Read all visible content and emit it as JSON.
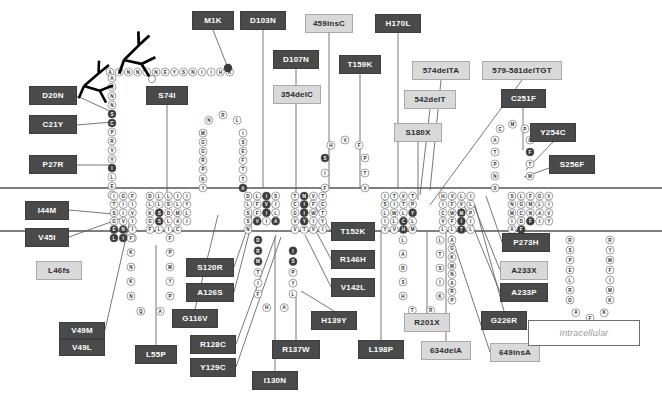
{
  "diagram": {
    "colors": {
      "mutation_dark_bg": "#4a4a4a",
      "mutation_dark_text": "#ffffff",
      "mutation_light_bg": "#d9d9d9",
      "mutation_light_text": "#2b2b2b",
      "residue_normal_fill": "#ffffff",
      "residue_mutated_fill": "#3a3a3a",
      "membrane_line": "#000000",
      "leader_line": "#555555"
    },
    "membrane": {
      "outer_line_y": 188,
      "inner_line_y": 231
    },
    "region_label": {
      "text": "Intracellular",
      "x": 578,
      "y": 333
    }
  },
  "mutations": [
    {
      "label": "M1K",
      "style": "dark",
      "x": 192,
      "y": 11,
      "w": 42,
      "h": 19
    },
    {
      "label": "D103N",
      "style": "dark",
      "x": 240,
      "y": 11,
      "w": 46,
      "h": 19
    },
    {
      "label": "459insC",
      "style": "light",
      "x": 305,
      "y": 14,
      "w": 48,
      "h": 19
    },
    {
      "label": "H170L",
      "style": "dark",
      "x": 375,
      "y": 14,
      "w": 46,
      "h": 19
    },
    {
      "label": "D107N",
      "style": "dark",
      "x": 273,
      "y": 50,
      "w": 46,
      "h": 19
    },
    {
      "label": "T159K",
      "style": "dark",
      "x": 339,
      "y": 55,
      "w": 42,
      "h": 19
    },
    {
      "label": "574delTA",
      "style": "light",
      "x": 412,
      "y": 61,
      "w": 58,
      "h": 19
    },
    {
      "label": "579-581delTGT",
      "style": "light",
      "x": 482,
      "y": 61,
      "w": 80,
      "h": 19
    },
    {
      "label": "354delC",
      "style": "light",
      "x": 273,
      "y": 85,
      "w": 48,
      "h": 19
    },
    {
      "label": "542delT",
      "style": "light",
      "x": 404,
      "y": 90,
      "w": 52,
      "h": 19
    },
    {
      "label": "C251F",
      "style": "dark",
      "x": 501,
      "y": 89,
      "w": 45,
      "h": 19
    },
    {
      "label": "D20N",
      "style": "dark",
      "x": 29,
      "y": 86,
      "w": 48,
      "h": 19
    },
    {
      "label": "S74I",
      "style": "dark",
      "x": 146,
      "y": 86,
      "w": 42,
      "h": 19
    },
    {
      "label": "S180X",
      "style": "light",
      "x": 394,
      "y": 123,
      "w": 48,
      "h": 19
    },
    {
      "label": "Y254C",
      "style": "dark",
      "x": 530,
      "y": 123,
      "w": 46,
      "h": 19
    },
    {
      "label": "C21Y",
      "style": "dark",
      "x": 29,
      "y": 115,
      "w": 48,
      "h": 19
    },
    {
      "label": "P27R",
      "style": "dark",
      "x": 29,
      "y": 155,
      "w": 48,
      "h": 19
    },
    {
      "label": "S256F",
      "style": "dark",
      "x": 549,
      "y": 155,
      "w": 46,
      "h": 19
    },
    {
      "label": "I44M",
      "style": "dark",
      "x": 25,
      "y": 201,
      "w": 44,
      "h": 19
    },
    {
      "label": "V45I",
      "style": "dark",
      "x": 25,
      "y": 228,
      "w": 44,
      "h": 19
    },
    {
      "label": "L46fs",
      "style": "light",
      "x": 36,
      "y": 261,
      "w": 46,
      "h": 19
    },
    {
      "label": "T152K",
      "style": "dark",
      "x": 331,
      "y": 222,
      "w": 44,
      "h": 19
    },
    {
      "label": "P273H",
      "style": "dark",
      "x": 502,
      "y": 233,
      "w": 48,
      "h": 19
    },
    {
      "label": "S120R",
      "style": "dark",
      "x": 186,
      "y": 258,
      "w": 48,
      "h": 19
    },
    {
      "label": "R146H",
      "style": "dark",
      "x": 331,
      "y": 250,
      "w": 44,
      "h": 19
    },
    {
      "label": "A233X",
      "style": "light",
      "x": 500,
      "y": 261,
      "w": 48,
      "h": 19
    },
    {
      "label": "A126S",
      "style": "dark",
      "x": 186,
      "y": 283,
      "w": 48,
      "h": 19
    },
    {
      "label": "V142L",
      "style": "dark",
      "x": 331,
      "y": 278,
      "w": 44,
      "h": 19
    },
    {
      "label": "A233P",
      "style": "dark",
      "x": 500,
      "y": 283,
      "w": 48,
      "h": 19
    },
    {
      "label": "G116V",
      "style": "dark",
      "x": 172,
      "y": 309,
      "w": 46,
      "h": 19
    },
    {
      "label": "H139Y",
      "style": "dark",
      "x": 311,
      "y": 311,
      "w": 46,
      "h": 19
    },
    {
      "label": "R201X",
      "style": "light",
      "x": 404,
      "y": 313,
      "w": 46,
      "h": 19
    },
    {
      "label": "G226R",
      "style": "dark",
      "x": 481,
      "y": 311,
      "w": 46,
      "h": 19
    },
    {
      "label": "V49M",
      "style": "dark",
      "x": 59,
      "y": 322,
      "w": 46,
      "h": 17
    },
    {
      "label": "V49L",
      "style": "dark",
      "x": 59,
      "y": 339,
      "w": 46,
      "h": 17
    },
    {
      "label": "R128C",
      "style": "dark",
      "x": 190,
      "y": 335,
      "w": 46,
      "h": 19
    },
    {
      "label": "R137W",
      "style": "dark",
      "x": 272,
      "y": 340,
      "w": 48,
      "h": 19
    },
    {
      "label": "L198P",
      "style": "dark",
      "x": 358,
      "y": 340,
      "w": 46,
      "h": 19
    },
    {
      "label": "634delA",
      "style": "light",
      "x": 421,
      "y": 341,
      "w": 50,
      "h": 19
    },
    {
      "label": "649insA",
      "style": "light",
      "x": 490,
      "y": 343,
      "w": 50,
      "h": 19
    },
    {
      "label": "L55P",
      "style": "dark",
      "x": 135,
      "y": 345,
      "w": 42,
      "h": 19
    },
    {
      "label": "Y129C",
      "style": "dark",
      "x": 190,
      "y": 358,
      "w": 46,
      "h": 19
    },
    {
      "label": "I130N",
      "style": "dark",
      "x": 252,
      "y": 371,
      "w": 46,
      "h": 19
    }
  ],
  "leaders": [
    {
      "from": [
        213,
        30
      ],
      "to": [
        228,
        68
      ]
    },
    {
      "from": [
        263,
        30
      ],
      "to": [
        263,
        188
      ]
    },
    {
      "from": [
        329,
        33
      ],
      "to": [
        329,
        188
      ]
    },
    {
      "from": [
        398,
        33
      ],
      "to": [
        398,
        188
      ]
    },
    {
      "from": [
        296,
        69
      ],
      "to": [
        296,
        85
      ]
    },
    {
      "from": [
        360,
        74
      ],
      "to": [
        360,
        188
      ]
    },
    {
      "from": [
        441,
        80
      ],
      "to": [
        430,
        190
      ]
    },
    {
      "from": [
        522,
        80
      ],
      "to": [
        430,
        205
      ]
    },
    {
      "from": [
        296,
        104
      ],
      "to": [
        296,
        192
      ]
    },
    {
      "from": [
        430,
        109
      ],
      "to": [
        420,
        195
      ]
    },
    {
      "from": [
        523,
        108
      ],
      "to": [
        523,
        150
      ]
    },
    {
      "from": [
        77,
        96
      ],
      "to": [
        112,
        112
      ]
    },
    {
      "from": [
        167,
        105
      ],
      "to": [
        167,
        200
      ]
    },
    {
      "from": [
        418,
        142
      ],
      "to": [
        418,
        200
      ]
    },
    {
      "from": [
        553,
        142
      ],
      "to": [
        526,
        170
      ]
    },
    {
      "from": [
        77,
        125
      ],
      "to": [
        112,
        122
      ]
    },
    {
      "from": [
        77,
        165
      ],
      "to": [
        112,
        165
      ]
    },
    {
      "from": [
        549,
        168
      ],
      "to": [
        524,
        177
      ]
    },
    {
      "from": [
        69,
        210
      ],
      "to": [
        113,
        214
      ]
    },
    {
      "from": [
        69,
        237
      ],
      "to": [
        122,
        218
      ]
    },
    {
      "from": [
        331,
        231
      ],
      "to": [
        311,
        200
      ]
    },
    {
      "from": [
        502,
        242
      ],
      "to": [
        486,
        196
      ]
    },
    {
      "from": [
        234,
        267
      ],
      "to": [
        252,
        215
      ]
    },
    {
      "from": [
        331,
        259
      ],
      "to": [
        311,
        222
      ]
    },
    {
      "from": [
        500,
        270
      ],
      "to": [
        470,
        196
      ]
    },
    {
      "from": [
        234,
        292
      ],
      "to": [
        252,
        222
      ]
    },
    {
      "from": [
        331,
        287
      ],
      "to": [
        305,
        235
      ]
    },
    {
      "from": [
        500,
        292
      ],
      "to": [
        462,
        200
      ]
    },
    {
      "from": [
        195,
        309
      ],
      "to": [
        218,
        215
      ]
    },
    {
      "from": [
        334,
        311
      ],
      "to": [
        301,
        291
      ]
    },
    {
      "from": [
        427,
        313
      ],
      "to": [
        427,
        232
      ]
    },
    {
      "from": [
        504,
        311
      ],
      "to": [
        475,
        205
      ]
    },
    {
      "from": [
        105,
        330
      ],
      "to": [
        130,
        220
      ]
    },
    {
      "from": [
        236,
        344
      ],
      "to": [
        276,
        235
      ]
    },
    {
      "from": [
        296,
        340
      ],
      "to": [
        296,
        292
      ]
    },
    {
      "from": [
        381,
        340
      ],
      "to": [
        381,
        232
      ]
    },
    {
      "from": [
        446,
        341
      ],
      "to": [
        446,
        232
      ]
    },
    {
      "from": [
        490,
        352
      ],
      "to": [
        451,
        235
      ]
    },
    {
      "from": [
        156,
        345
      ],
      "to": [
        156,
        245
      ]
    },
    {
      "from": [
        236,
        367
      ],
      "to": [
        281,
        237
      ]
    },
    {
      "from": [
        275,
        371
      ],
      "to": [
        275,
        237
      ]
    }
  ],
  "residue_chains": {
    "n_terminal_extracellular": "A T N N I N E Y S N I I H K",
    "n_terminal_vertical": "A R N N S C P R V V I L E E",
    "loop1_extracellular": "Y K P R G G M N R L I S E F T T A",
    "tm_segment_1": "I G F T I I S I V G V I E N I L I A",
    "loop_intracellular_1": "F K N K N Q A P Y M P F",
    "tm_segment_2": "D L L I I L L S L Y K S D M L G S L A I F L I C",
    "tm_segment_3": "D L I S L F V I S F I L S V I A N",
    "intracellular_loop_2": "D R M T I F H A L Y P S I",
    "tm_segment_4": "T M V T C I F C G I W T V Y I Y V T V I V",
    "loop2_extracellular": "F I S H V F P T V",
    "tm_segment_5": "I T V T S I T P L W L Y I L C L Y V H M",
    "intracellular_loop_3": "L A R S H T R K I S T L",
    "tm_segment_6": "H V L I I F V L C W M P V F I I L L T L T",
    "intracellular_loop_4": "A G K M N A R P",
    "loop3_extracellular": "S N P T A C M P C F T M",
    "tm_segment_7": "S L F G V N G M L I M C N A V I D F I Y A F",
    "c_terminal": "R S P E L R D A F K K M I F W Y R S C"
  },
  "glycosylation_sites": [
    {
      "x": 118,
      "y": 55
    },
    {
      "x": 78,
      "y": 82
    }
  ]
}
